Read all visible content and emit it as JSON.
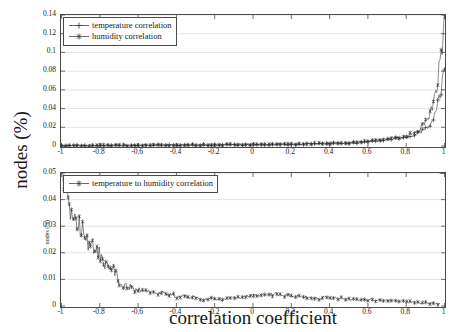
{
  "figure": {
    "xlabel": "correlation coefficient",
    "ylabel_main": "nodes (%)",
    "ylabel_sub": "nodes (%)"
  },
  "top_legend": {
    "items": [
      {
        "label": "temperature correlation",
        "marker": "plus-marker"
      },
      {
        "label": "humidity correlation",
        "marker": "asterisk-marker"
      }
    ]
  },
  "bottom_legend": {
    "items": [
      {
        "label": "temperature to humidity correlation",
        "marker": "asterisk-marker"
      }
    ]
  },
  "top_yticks": [
    "0",
    "0.02",
    "0.04",
    "0.06",
    "0.08",
    "0.1",
    "0.12",
    "0.14"
  ],
  "bottom_yticks": [
    "0",
    "0.01",
    "0.02",
    "0.03",
    "0.04",
    "0.05"
  ],
  "xticks": [
    "-1",
    "-0.8",
    "-0.6",
    "-0.4",
    "-0.2",
    "0",
    "0.2",
    "0.4",
    "0.6",
    "0.8",
    "1"
  ],
  "chart_data": [
    {
      "type": "line",
      "id": "top-panel",
      "title": "",
      "xlabel": "correlation coefficient",
      "ylabel": "nodes (%)",
      "xlim": [
        -1,
        1
      ],
      "ylim": [
        0,
        0.14
      ],
      "xticks": [
        -1,
        -0.8,
        -0.6,
        -0.4,
        -0.2,
        0,
        0.2,
        0.4,
        0.6,
        0.8,
        1
      ],
      "yticks": [
        0,
        0.02,
        0.04,
        0.06,
        0.08,
        0.1,
        0.12,
        0.14
      ],
      "grid": true,
      "legend_position": "upper-left",
      "color": "#2b2b2b",
      "series": [
        {
          "name": "temperature correlation",
          "marker": "+",
          "x": [
            -1.0,
            -0.98,
            -0.96,
            -0.94,
            -0.92,
            -0.9,
            -0.88,
            -0.86,
            -0.84,
            -0.82,
            -0.8,
            -0.78,
            -0.76,
            -0.74,
            -0.72,
            -0.7,
            -0.68,
            -0.66,
            -0.64,
            -0.62,
            -0.6,
            -0.58,
            -0.56,
            -0.54,
            -0.52,
            -0.5,
            -0.48,
            -0.46,
            -0.44,
            -0.42,
            -0.4,
            -0.38,
            -0.36,
            -0.34,
            -0.32,
            -0.3,
            -0.28,
            -0.26,
            -0.24,
            -0.22,
            -0.2,
            -0.18,
            -0.16,
            -0.14,
            -0.12,
            -0.1,
            -0.08,
            -0.06,
            -0.04,
            -0.02,
            0.0,
            0.02,
            0.04,
            0.06,
            0.08,
            0.1,
            0.12,
            0.14,
            0.16,
            0.18,
            0.2,
            0.22,
            0.24,
            0.26,
            0.28,
            0.3,
            0.32,
            0.34,
            0.36,
            0.38,
            0.4,
            0.42,
            0.44,
            0.46,
            0.48,
            0.5,
            0.52,
            0.54,
            0.56,
            0.58,
            0.6,
            0.62,
            0.64,
            0.66,
            0.68,
            0.7,
            0.72,
            0.74,
            0.76,
            0.78,
            0.8,
            0.82,
            0.84,
            0.86,
            0.88,
            0.9,
            0.92,
            0.94,
            0.96,
            0.98,
            1.0
          ],
          "y": [
            0.0005,
            0.0004,
            0.0005,
            0.0004,
            0.0005,
            0.0004,
            0.0005,
            0.0006,
            0.0005,
            0.0004,
            0.0005,
            0.0006,
            0.0005,
            0.0006,
            0.0005,
            0.0006,
            0.0007,
            0.0006,
            0.0007,
            0.0006,
            0.0007,
            0.0008,
            0.0007,
            0.0008,
            0.0007,
            0.0008,
            0.0009,
            0.0008,
            0.0009,
            0.0008,
            0.0009,
            0.001,
            0.0009,
            0.001,
            0.0011,
            0.001,
            0.0011,
            0.001,
            0.0012,
            0.0011,
            0.0012,
            0.0011,
            0.0013,
            0.0012,
            0.0013,
            0.0012,
            0.0014,
            0.0013,
            0.0014,
            0.0013,
            0.0015,
            0.0014,
            0.0016,
            0.0015,
            0.0017,
            0.0016,
            0.0018,
            0.0017,
            0.0019,
            0.0018,
            0.002,
            0.0019,
            0.0021,
            0.002,
            0.0022,
            0.0021,
            0.0024,
            0.0022,
            0.0025,
            0.0024,
            0.0027,
            0.0026,
            0.0029,
            0.0028,
            0.0031,
            0.003,
            0.0034,
            0.0036,
            0.004,
            0.0044,
            0.0048,
            0.0052,
            0.0055,
            0.006,
            0.0064,
            0.0068,
            0.0072,
            0.0078,
            0.0084,
            0.009,
            0.0098,
            0.0108,
            0.012,
            0.0136,
            0.0156,
            0.0185,
            0.023,
            0.031,
            0.045,
            0.062,
            0.072
          ]
        },
        {
          "name": "humidity correlation",
          "marker": "*",
          "x": [
            -1.0,
            -0.98,
            -0.96,
            -0.94,
            -0.92,
            -0.9,
            -0.88,
            -0.86,
            -0.84,
            -0.82,
            -0.8,
            -0.78,
            -0.76,
            -0.74,
            -0.72,
            -0.7,
            -0.68,
            -0.66,
            -0.64,
            -0.62,
            -0.6,
            -0.58,
            -0.56,
            -0.54,
            -0.52,
            -0.5,
            -0.48,
            -0.46,
            -0.44,
            -0.42,
            -0.4,
            -0.38,
            -0.36,
            -0.34,
            -0.32,
            -0.3,
            -0.28,
            -0.26,
            -0.24,
            -0.22,
            -0.2,
            -0.18,
            -0.16,
            -0.14,
            -0.12,
            -0.1,
            -0.08,
            -0.06,
            -0.04,
            -0.02,
            0.0,
            0.02,
            0.04,
            0.06,
            0.08,
            0.1,
            0.12,
            0.14,
            0.16,
            0.18,
            0.2,
            0.22,
            0.24,
            0.26,
            0.28,
            0.3,
            0.32,
            0.34,
            0.36,
            0.38,
            0.4,
            0.42,
            0.44,
            0.46,
            0.48,
            0.5,
            0.52,
            0.54,
            0.56,
            0.58,
            0.6,
            0.62,
            0.64,
            0.66,
            0.68,
            0.7,
            0.72,
            0.74,
            0.76,
            0.78,
            0.8,
            0.82,
            0.84,
            0.86,
            0.88,
            0.9,
            0.92,
            0.94,
            0.96,
            0.98,
            1.0
          ],
          "y": [
            0.0004,
            0.0005,
            0.0004,
            0.0005,
            0.0004,
            0.0005,
            0.0004,
            0.0005,
            0.0006,
            0.0005,
            0.0006,
            0.0005,
            0.0006,
            0.0005,
            0.0006,
            0.0007,
            0.0006,
            0.0007,
            0.0006,
            0.0007,
            0.0008,
            0.0007,
            0.0008,
            0.0007,
            0.0008,
            0.0009,
            0.0008,
            0.0009,
            0.0008,
            0.0009,
            0.001,
            0.0009,
            0.001,
            0.0009,
            0.0011,
            0.001,
            0.0011,
            0.0012,
            0.0011,
            0.0012,
            0.0011,
            0.0013,
            0.0012,
            0.0013,
            0.0014,
            0.0013,
            0.0014,
            0.0015,
            0.0014,
            0.0016,
            0.0015,
            0.0017,
            0.0016,
            0.0018,
            0.0017,
            0.0019,
            0.0018,
            0.002,
            0.0019,
            0.0021,
            0.002,
            0.0022,
            0.0021,
            0.0023,
            0.0022,
            0.0024,
            0.0026,
            0.0025,
            0.0027,
            0.0026,
            0.0029,
            0.0028,
            0.0031,
            0.003,
            0.0033,
            0.0035,
            0.0038,
            0.0042,
            0.0046,
            0.005,
            0.0054,
            0.0058,
            0.0062,
            0.0067,
            0.0072,
            0.0076,
            0.0082,
            0.0088,
            0.0095,
            0.0102,
            0.0112,
            0.0124,
            0.014,
            0.0162,
            0.0195,
            0.024,
            0.032,
            0.045,
            0.066,
            0.093,
            0.133
          ]
        }
      ]
    },
    {
      "type": "line",
      "id": "bottom-panel",
      "title": "",
      "xlabel": "correlation coefficient",
      "ylabel": "nodes (%)",
      "xlim": [
        -1,
        1
      ],
      "ylim": [
        0,
        0.05
      ],
      "xticks": [
        -1,
        -0.8,
        -0.6,
        -0.4,
        -0.2,
        0,
        0.2,
        0.4,
        0.6,
        0.8,
        1
      ],
      "yticks": [
        0,
        0.01,
        0.02,
        0.03,
        0.04,
        0.05
      ],
      "grid": true,
      "legend_position": "upper-left",
      "color": "#2b2b2b",
      "series": [
        {
          "name": "temperature to humidity correlation",
          "marker": "*",
          "x": [
            -1.0,
            -0.99,
            -0.98,
            -0.97,
            -0.96,
            -0.95,
            -0.94,
            -0.93,
            -0.92,
            -0.91,
            -0.9,
            -0.89,
            -0.88,
            -0.87,
            -0.86,
            -0.85,
            -0.84,
            -0.83,
            -0.82,
            -0.81,
            -0.8,
            -0.79,
            -0.78,
            -0.77,
            -0.76,
            -0.75,
            -0.74,
            -0.73,
            -0.72,
            -0.71,
            -0.7,
            -0.68,
            -0.66,
            -0.64,
            -0.62,
            -0.6,
            -0.58,
            -0.56,
            -0.54,
            -0.52,
            -0.5,
            -0.48,
            -0.46,
            -0.44,
            -0.42,
            -0.4,
            -0.38,
            -0.36,
            -0.34,
            -0.32,
            -0.3,
            -0.28,
            -0.26,
            -0.24,
            -0.22,
            -0.2,
            -0.18,
            -0.16,
            -0.14,
            -0.12,
            -0.1,
            -0.08,
            -0.06,
            -0.04,
            -0.02,
            0.0,
            0.02,
            0.04,
            0.06,
            0.08,
            0.1,
            0.12,
            0.14,
            0.16,
            0.18,
            0.2,
            0.22,
            0.24,
            0.26,
            0.28,
            0.3,
            0.32,
            0.34,
            0.36,
            0.38,
            0.4,
            0.42,
            0.44,
            0.46,
            0.48,
            0.5,
            0.52,
            0.54,
            0.56,
            0.58,
            0.6,
            0.62,
            0.64,
            0.66,
            0.68,
            0.7,
            0.72,
            0.74,
            0.76,
            0.78,
            0.8,
            0.82,
            0.84,
            0.86,
            0.88,
            0.9,
            0.92,
            0.94,
            0.96,
            0.98,
            1.0
          ],
          "y": [
            0.0475,
            0.0415,
            0.0425,
            0.0395,
            0.0385,
            0.0368,
            0.0355,
            0.0345,
            0.0332,
            0.0318,
            0.0305,
            0.0292,
            0.0275,
            0.0262,
            0.0228,
            0.0235,
            0.0222,
            0.0228,
            0.0212,
            0.0205,
            0.0192,
            0.0172,
            0.0162,
            0.0168,
            0.0155,
            0.0148,
            0.0158,
            0.0142,
            0.0132,
            0.0122,
            0.0092,
            0.0068,
            0.0078,
            0.0072,
            0.0062,
            0.0058,
            0.0065,
            0.0055,
            0.006,
            0.005,
            0.0048,
            0.0052,
            0.0045,
            0.0042,
            0.0048,
            0.0028,
            0.0035,
            0.004,
            0.0032,
            0.0038,
            0.003,
            0.0026,
            0.0022,
            0.0026,
            0.003,
            0.0024,
            0.0028,
            0.0022,
            0.0026,
            0.0032,
            0.0028,
            0.0035,
            0.0032,
            0.0038,
            0.0034,
            0.0042,
            0.0036,
            0.0044,
            0.0038,
            0.0046,
            0.0042,
            0.0048,
            0.0044,
            0.0038,
            0.0042,
            0.0036,
            0.0032,
            0.0036,
            0.003,
            0.0034,
            0.0028,
            0.0032,
            0.0026,
            0.003,
            0.0035,
            0.0028,
            0.0032,
            0.0026,
            0.003,
            0.0025,
            0.0028,
            0.0024,
            0.0026,
            0.0022,
            0.0025,
            0.0021,
            0.0024,
            0.002,
            0.0022,
            0.0019,
            0.0021,
            0.0018,
            0.002,
            0.0017,
            0.0018,
            0.0015,
            0.0016,
            0.0013,
            0.0014,
            0.0011,
            0.0012,
            0.001,
            0.0009,
            0.0008,
            0.0007
          ]
        }
      ]
    }
  ]
}
